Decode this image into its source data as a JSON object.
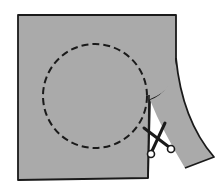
{
  "diagram": {
    "colors": {
      "paper": "#aaaaaa",
      "outline": "#1a1a1a",
      "background": "#ffffff"
    },
    "elements": [
      {
        "name": "paper-sheet",
        "shape": "square"
      },
      {
        "name": "dashed-circle",
        "style": "dashed"
      },
      {
        "name": "curled-strip",
        "shape": "curving strip"
      },
      {
        "name": "scissors-icon",
        "shape": "scissors"
      }
    ]
  }
}
